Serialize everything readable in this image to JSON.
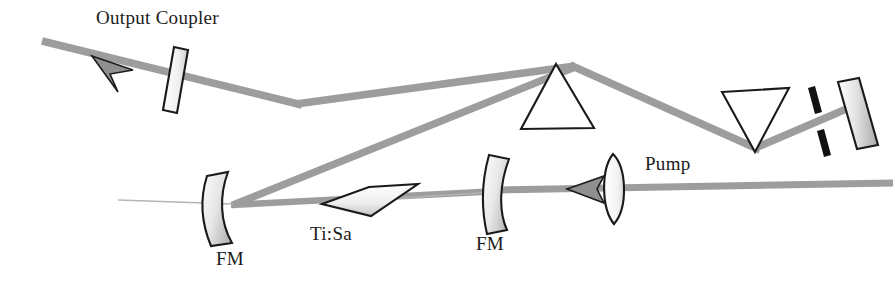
{
  "figure": {
    "background_color": "#ffffff",
    "beam_color": "#9d9d9d",
    "outline_color": "#1a1a1a",
    "width": 895,
    "height": 287
  },
  "labels": {
    "output_coupler": "Output Coupler",
    "fm_left": "FM",
    "ti_sa": "Ti:Sa",
    "fm_right": "FM",
    "pump": "Pump"
  },
  "components": [
    {
      "name": "output-coupler-mirror",
      "type": "partial-mirror",
      "label": "Output Coupler"
    },
    {
      "name": "folding-mirror-left",
      "type": "curved-mirror",
      "label": "FM"
    },
    {
      "name": "ti-sapphire-crystal",
      "type": "brewster-crystal",
      "label": "Ti:Sa"
    },
    {
      "name": "folding-mirror-right",
      "type": "curved-mirror",
      "label": "FM"
    },
    {
      "name": "pump-lens",
      "type": "lens",
      "label": ""
    },
    {
      "name": "prism-one",
      "type": "prism-upright",
      "label": ""
    },
    {
      "name": "prism-two",
      "type": "prism-inverted",
      "label": ""
    },
    {
      "name": "slit-aperture",
      "type": "slit",
      "label": ""
    },
    {
      "name": "end-mirror",
      "type": "high-reflector",
      "label": ""
    }
  ],
  "beams": [
    {
      "name": "output-beam",
      "kind": "output",
      "direction": "up-left"
    },
    {
      "name": "cavity-beam-upper",
      "kind": "intracavity"
    },
    {
      "name": "cavity-beam-lower",
      "kind": "intracavity"
    },
    {
      "name": "cavity-beam-horizontal",
      "kind": "intracavity"
    },
    {
      "name": "pump-beam",
      "kind": "pump",
      "direction": "left"
    }
  ],
  "geometry": {
    "output_beam": {
      "x1": 42,
      "y1": 41,
      "x2": 300,
      "y2": 105
    },
    "upper_beam": {
      "x1": 300,
      "y1": 105,
      "x2": 573,
      "y2": 66
    },
    "prism1_to_prism2": {
      "x1": 573,
      "y1": 66,
      "x2": 757,
      "y2": 148
    },
    "prism2_to_mirror": {
      "x1": 757,
      "y1": 148,
      "x2": 856,
      "y2": 104
    },
    "lower_beam": {
      "x1": 231,
      "y1": 204,
      "x2": 573,
      "y2": 66
    },
    "horizontal_beam": {
      "x1": 231,
      "y1": 204,
      "x2": 497,
      "y2": 190
    },
    "pump_beam": {
      "x1": 497,
      "y1": 190,
      "x2": 893,
      "y2": 183
    }
  },
  "label_positions": {
    "output_coupler": {
      "x": 96,
      "y": 24
    },
    "fm_left": {
      "x": 216,
      "y": 265
    },
    "ti_sa": {
      "x": 310,
      "y": 240
    },
    "fm_right": {
      "x": 476,
      "y": 250
    },
    "pump": {
      "x": 645,
      "y": 170
    }
  }
}
